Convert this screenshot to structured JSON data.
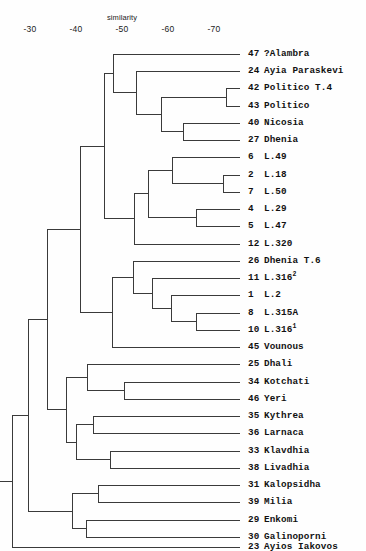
{
  "figure": {
    "kind": "dendrogram",
    "axis_title": "similarity"
  },
  "axis": {
    "title": "similarity",
    "ticks": [
      {
        "label": "-30",
        "x": 30
      },
      {
        "label": "-40",
        "x": 76
      },
      {
        "label": "-50",
        "x": 122
      },
      {
        "label": "-60",
        "x": 168
      },
      {
        "label": "-70",
        "x": 214
      }
    ]
  },
  "leaves": [
    {
      "num": "47",
      "name": "?Alambra",
      "sup": ""
    },
    {
      "num": "24",
      "name": "Ayia Paraskevi",
      "sup": ""
    },
    {
      "num": "42",
      "name": "Politico T.4",
      "sup": ""
    },
    {
      "num": "43",
      "name": "Politico",
      "sup": ""
    },
    {
      "num": "40",
      "name": "Nicosia",
      "sup": ""
    },
    {
      "num": "27",
      "name": "Dhenia",
      "sup": ""
    },
    {
      "num": "6",
      "name": "L.49",
      "sup": ""
    },
    {
      "num": "2",
      "name": "L.18",
      "sup": ""
    },
    {
      "num": "7",
      "name": "L.50",
      "sup": ""
    },
    {
      "num": "4",
      "name": "L.29",
      "sup": ""
    },
    {
      "num": "5",
      "name": "L.47",
      "sup": ""
    },
    {
      "num": "12",
      "name": "L.320",
      "sup": ""
    },
    {
      "num": "26",
      "name": "Dhenia T.6",
      "sup": ""
    },
    {
      "num": "11",
      "name": "L.316",
      "sup": "2"
    },
    {
      "num": "1",
      "name": "L.2",
      "sup": ""
    },
    {
      "num": "8",
      "name": "L.315A",
      "sup": ""
    },
    {
      "num": "10",
      "name": "L.316",
      "sup": "1"
    },
    {
      "num": "45",
      "name": "Vounous",
      "sup": ""
    },
    {
      "num": "25",
      "name": "Dhali",
      "sup": ""
    },
    {
      "num": "34",
      "name": "Kotchati",
      "sup": ""
    },
    {
      "num": "46",
      "name": "Yeri",
      "sup": ""
    },
    {
      "num": "35",
      "name": "Kythrea",
      "sup": ""
    },
    {
      "num": "36",
      "name": "Larnaca",
      "sup": ""
    },
    {
      "num": "33",
      "name": "Klavdhia",
      "sup": ""
    },
    {
      "num": "38",
      "name": "Livadhia",
      "sup": ""
    },
    {
      "num": "31",
      "name": "Kalopsidha",
      "sup": ""
    },
    {
      "num": "39",
      "name": "Milia",
      "sup": ""
    },
    {
      "num": "29",
      "name": "Enkomi",
      "sup": ""
    },
    {
      "num": "30",
      "name": "Galinoporni",
      "sup": ""
    },
    {
      "num": "23",
      "name": "Ayios Iakovos",
      "sup": ""
    }
  ],
  "chart_data": {
    "type": "dendrogram",
    "title": "",
    "xlabel": "similarity",
    "ylabel": "",
    "axis_ticks": [
      "-30",
      "-40",
      "-50",
      "-60",
      "-70"
    ],
    "axis_direction": "decreasing-similarity-to-the-right",
    "n_leaves": 30,
    "leaf_order": [
      "47 ?Alambra",
      "24 Ayia Paraskevi",
      "42 Politico T.4",
      "43 Politico",
      "40 Nicosia",
      "27 Dhenia",
      "6 L.49",
      "2 L.18",
      "7 L.50",
      "4 L.29",
      "5 L.47",
      "12 L.320",
      "26 Dhenia T.6",
      "11 L.316^2",
      "1 L.2",
      "8 L.315A",
      "10 L.316^1",
      "45 Vounous",
      "25 Dhali",
      "34 Kotchati",
      "46 Yeri",
      "35 Kythrea",
      "36 Larnaca",
      "33 Klavdhia",
      "38 Livadhia",
      "31 Kalopsidha",
      "39 Milia",
      "29 Enkomi",
      "30 Galinoporni",
      "23 Ayios Iakovos"
    ],
    "leaf_y": [
      54,
      71,
      88,
      106,
      123,
      140,
      157,
      175,
      192,
      209,
      226,
      244,
      261,
      278,
      295,
      313,
      330,
      347,
      364,
      382,
      399,
      416,
      433,
      451,
      468,
      485,
      502,
      520,
      537,
      547
    ],
    "merges": [
      {
        "id": "n_42_43",
        "x": 226,
        "children": [
          "42 Politico T.4",
          "43 Politico"
        ]
      },
      {
        "id": "n_40_27",
        "x": 183,
        "children": [
          "40 Nicosia",
          "27 Dhenia"
        ]
      },
      {
        "id": "n_politico_nic",
        "x": 161,
        "children": [
          "n_42_43",
          "n_40_27"
        ]
      },
      {
        "id": "n_24_grp",
        "x": 136,
        "children": [
          "24 Ayia Paraskevi",
          "n_politico_nic"
        ]
      },
      {
        "id": "n_47_grp",
        "x": 113,
        "children": [
          "47 ?Alambra",
          "n_24_grp"
        ]
      },
      {
        "id": "n_2_7",
        "x": 223,
        "children": [
          "2 L.18",
          "7 L.50"
        ]
      },
      {
        "id": "n_6_27",
        "x": 172,
        "children": [
          "6 L.49",
          "n_2_7"
        ]
      },
      {
        "id": "n_4_5",
        "x": 196,
        "children": [
          "4 L.29",
          "5 L.47"
        ]
      },
      {
        "id": "n_L_upper",
        "x": 148,
        "children": [
          "n_6_27",
          "n_4_5"
        ]
      },
      {
        "id": "n_L_with_320",
        "x": 134,
        "children": [
          "n_L_upper",
          "12 L.320"
        ]
      },
      {
        "id": "n_top_block",
        "x": 104,
        "children": [
          "n_47_grp",
          "n_L_with_320"
        ]
      },
      {
        "id": "n_8_10",
        "x": 196,
        "children": [
          "8 L.315A",
          "10 L.316^1"
        ]
      },
      {
        "id": "n_1_810",
        "x": 171,
        "children": [
          "1 L.2",
          "n_8_10"
        ]
      },
      {
        "id": "n_11_grp",
        "x": 152,
        "children": [
          "11 L.316^2",
          "n_1_810"
        ]
      },
      {
        "id": "n_26_grp",
        "x": 133,
        "children": [
          "26 Dhenia T.6",
          "n_11_grp"
        ]
      },
      {
        "id": "n_L31x_45",
        "x": 112,
        "children": [
          "n_26_grp",
          "45 Vounous"
        ]
      },
      {
        "id": "n_upper_all",
        "x": 80,
        "children": [
          "n_top_block",
          "n_L31x_45"
        ]
      },
      {
        "id": "n_34_46",
        "x": 124,
        "children": [
          "34 Kotchati",
          "46 Yeri"
        ]
      },
      {
        "id": "n_25_grp",
        "x": 87,
        "children": [
          "25 Dhali",
          "n_34_46"
        ]
      },
      {
        "id": "n_35_36",
        "x": 93,
        "children": [
          "35 Kythrea",
          "36 Larnaca"
        ]
      },
      {
        "id": "n_33_38",
        "x": 110,
        "children": [
          "33 Klavdhia",
          "38 Livadhia"
        ]
      },
      {
        "id": "n_coast",
        "x": 76,
        "children": [
          "n_35_36",
          "n_33_38"
        ]
      },
      {
        "id": "n_mid_block",
        "x": 66,
        "children": [
          "n_25_grp",
          "n_coast"
        ]
      },
      {
        "id": "n_upper_mid",
        "x": 47,
        "children": [
          "n_upper_all",
          "n_mid_block"
        ]
      },
      {
        "id": "n_31_39",
        "x": 98,
        "children": [
          "31 Kalopsidha",
          "39 Milia"
        ]
      },
      {
        "id": "n_29_30",
        "x": 86,
        "children": [
          "29 Enkomi",
          "30 Galinoporni"
        ]
      },
      {
        "id": "n_east",
        "x": 72,
        "children": [
          "n_31_39",
          "n_29_30"
        ]
      },
      {
        "id": "n_penult",
        "x": 28,
        "children": [
          "n_upper_mid",
          "n_east"
        ]
      },
      {
        "id": "n_root",
        "x": 12,
        "children": [
          "n_penult",
          "23 Ayios Iakovos"
        ]
      }
    ]
  }
}
